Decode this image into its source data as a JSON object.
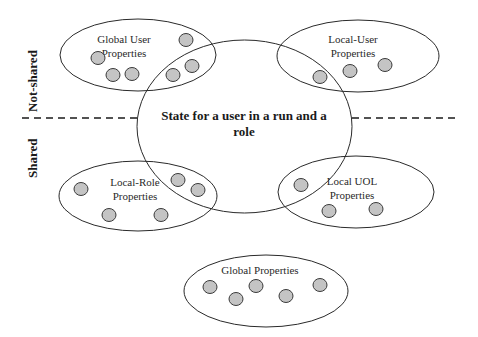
{
  "diagram": {
    "center": {
      "label_line1": "State for a user in a run and a",
      "label_line2": "role"
    },
    "divider": {
      "above_label": "Not-shared",
      "below_label": "Shared"
    },
    "groups": [
      {
        "id": "global-user",
        "label_line1": "Global User",
        "label_line2": "Properties",
        "property_count": 6
      },
      {
        "id": "local-user",
        "label_line1": "Local-User",
        "label_line2": "Properties",
        "property_count": 3
      },
      {
        "id": "local-role",
        "label_line1": "Local-Role",
        "label_line2": "Properties",
        "property_count": 5
      },
      {
        "id": "local-uol",
        "label_line1": "Local UOL",
        "label_line2": "Properties",
        "property_count": 3
      },
      {
        "id": "global",
        "label_line1": "Global Properties",
        "label_line2": "",
        "property_count": 5
      }
    ],
    "colors": {
      "stroke": "#2a2a2a",
      "property_fill": "#c4c4c4",
      "background": "#ffffff"
    }
  }
}
